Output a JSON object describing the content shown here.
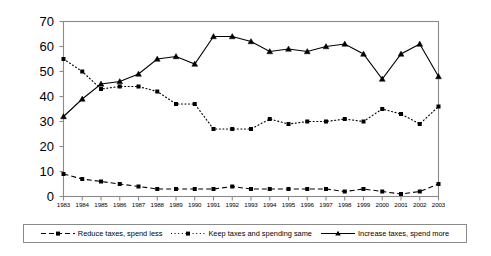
{
  "chart_data": {
    "type": "line",
    "title": "",
    "xlabel": "",
    "ylabel": "",
    "ylim": [
      0,
      70
    ],
    "ytick_step": 10,
    "grid": false,
    "legend_position": "bottom",
    "categories": [
      "1983",
      "1984",
      "1985",
      "1986",
      "1987",
      "1988",
      "1989",
      "1990",
      "1991",
      "1992",
      "1993",
      "1994",
      "1995",
      "1996",
      "1997",
      "1998",
      "1999",
      "2000",
      "2001",
      "2002",
      "2003"
    ],
    "yticks": [
      "0",
      "10",
      "20",
      "30",
      "40",
      "50",
      "60",
      "70"
    ],
    "series": [
      {
        "name": "Reduce taxes, spend less",
        "style": "dashed",
        "marker": "square",
        "color": "#000000",
        "values": [
          9,
          7,
          6,
          5,
          4,
          3,
          3,
          3,
          3,
          4,
          3,
          3,
          3,
          3,
          3,
          2,
          3,
          2,
          1,
          2,
          5
        ]
      },
      {
        "name": "Keep taxes and spending same",
        "style": "dotted",
        "marker": "square",
        "color": "#000000",
        "values": [
          55,
          50,
          43,
          44,
          44,
          42,
          37,
          37,
          27,
          27,
          27,
          31,
          29,
          30,
          30,
          31,
          30,
          35,
          33,
          29,
          36
        ]
      },
      {
        "name": "Increase taxes, spend more",
        "style": "solid",
        "marker": "triangle",
        "color": "#000000",
        "values": [
          32,
          39,
          45,
          46,
          49,
          55,
          56,
          53,
          64,
          64,
          62,
          58,
          59,
          58,
          60,
          61,
          57,
          47,
          57,
          61,
          48
        ]
      }
    ]
  },
  "legend": {
    "entries": [
      {
        "label": "Reduce taxes, spend less"
      },
      {
        "label": "Keep taxes and spending same"
      },
      {
        "label": "Increase taxes, spend more"
      }
    ]
  },
  "axes": {
    "frame_color": "#8a8a8a",
    "tick_color": "#8a8a8a"
  }
}
